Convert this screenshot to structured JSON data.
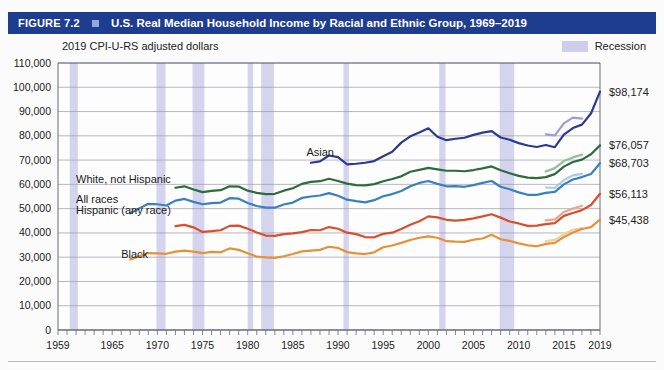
{
  "figure": {
    "number_label": "FIGURE 7.2",
    "marker_icon": "square-marker-icon",
    "title": "U.S. Real Median Household Income by Racial and Ethnic Group, 1969–2019",
    "subtitle": "2019 CPI-U-RS adjusted dollars"
  },
  "legend": {
    "items": [
      {
        "label": "Recession",
        "color": "#cdcdec",
        "swatch_icon": "recession-band-swatch"
      }
    ]
  },
  "chart_data": {
    "type": "line",
    "title": "U.S. Real Median Household Income by Racial and Ethnic Group, 1969–2019",
    "subtitle": "2019 CPI-U-RS adjusted dollars",
    "xlabel": "",
    "ylabel": "2019 CPI-U-RS adjusted dollars",
    "xlim": [
      1959,
      2019
    ],
    "ylim": [
      0,
      110000
    ],
    "grid": true,
    "legend_position": "top-right",
    "ytick_labels": [
      "0",
      "10,000",
      "20,000",
      "30,000",
      "40,000",
      "50,000",
      "60,000",
      "70,000",
      "80,000",
      "90,000",
      "100,000",
      "110,000"
    ],
    "yticks": [
      0,
      10000,
      20000,
      30000,
      40000,
      50000,
      60000,
      70000,
      80000,
      90000,
      100000,
      110000
    ],
    "xtick_labels": [
      "1959",
      "1965",
      "1970",
      "1975",
      "1980",
      "1985",
      "1990",
      "1995",
      "2000",
      "2005",
      "2010",
      "2015",
      "2019"
    ],
    "xticks": [
      1959,
      1965,
      1970,
      1975,
      1980,
      1985,
      1990,
      1995,
      2000,
      2005,
      2010,
      2015,
      2019
    ],
    "end_value_labels": [
      {
        "text": "$98,174",
        "series": "Asian",
        "value": 98174,
        "year": 2019
      },
      {
        "text": "$76,057",
        "series": "White, not Hispanic",
        "value": 76057,
        "year": 2019
      },
      {
        "text": "$68,703",
        "series": "All races",
        "value": 68703,
        "year": 2019
      },
      {
        "text": "$56,113",
        "series": "Hispanic (any race)",
        "value": 56113,
        "year": 2019
      },
      {
        "text": "$45,438",
        "series": "Black",
        "value": 45438,
        "year": 2019
      }
    ],
    "recession_bands": [
      {
        "start": 1960.3,
        "end": 1961.2
      },
      {
        "start": 1969.9,
        "end": 1970.9
      },
      {
        "start": 1973.9,
        "end": 1975.2
      },
      {
        "start": 1980.0,
        "end": 1980.6
      },
      {
        "start": 1981.5,
        "end": 1982.9
      },
      {
        "start": 1990.6,
        "end": 1991.2
      },
      {
        "start": 2001.2,
        "end": 2001.9
      },
      {
        "start": 2007.9,
        "end": 2009.5
      }
    ],
    "series": [
      {
        "name": "Asian",
        "color": "#2b3a8f",
        "redesign_color": "#9a9ed4",
        "label_x": 1986.5,
        "label_y": 71500,
        "x": [
          1987,
          1988,
          1989,
          1990,
          1991,
          1992,
          1993,
          1994,
          1995,
          1996,
          1997,
          1998,
          1999,
          2000,
          2001,
          2002,
          2003,
          2004,
          2005,
          2006,
          2007,
          2008,
          2009,
          2010,
          2011,
          2012,
          2013,
          2014,
          2015,
          2016,
          2017,
          2018,
          2019
        ],
        "values": [
          68900,
          69500,
          71900,
          71200,
          68200,
          68500,
          68900,
          69600,
          71600,
          73400,
          77200,
          79800,
          81400,
          83100,
          79600,
          78200,
          78800,
          79200,
          80400,
          81300,
          81900,
          79300,
          78400,
          77000,
          76000,
          75400,
          76200,
          75300,
          80500,
          83200,
          84600,
          89200,
          98174
        ],
        "redesign_x": [
          2013,
          2014,
          2015,
          2016,
          2017
        ],
        "redesign_values": [
          80600,
          80200,
          85100,
          87500,
          87100
        ]
      },
      {
        "name": "White, not Hispanic",
        "color": "#2f6b3a",
        "redesign_color": "#93bd9c",
        "label_x": 1961.0,
        "label_y": 60500,
        "x": [
          1972,
          1973,
          1974,
          1975,
          1976,
          1977,
          1978,
          1979,
          1980,
          1981,
          1982,
          1983,
          1984,
          1985,
          1986,
          1987,
          1988,
          1989,
          1990,
          1991,
          1992,
          1993,
          1994,
          1995,
          1996,
          1997,
          1998,
          1999,
          2000,
          2001,
          2002,
          2003,
          2004,
          2005,
          2006,
          2007,
          2008,
          2009,
          2010,
          2011,
          2012,
          2013,
          2014,
          2015,
          2016,
          2017,
          2018,
          2019
        ],
        "values": [
          58600,
          59200,
          57900,
          56800,
          57300,
          57600,
          59200,
          59100,
          57400,
          56500,
          56000,
          56100,
          57400,
          58400,
          60200,
          61000,
          61300,
          62300,
          61400,
          60300,
          59700,
          59600,
          60100,
          61300,
          62200,
          63300,
          65200,
          66000,
          66800,
          66200,
          65600,
          65600,
          65400,
          65900,
          66600,
          67400,
          65800,
          64600,
          63500,
          62800,
          62600,
          63000,
          64200,
          67300,
          69200,
          70200,
          72400,
          76057
        ],
        "redesign_x": [
          2013,
          2014,
          2015,
          2016,
          2017
        ],
        "redesign_values": [
          65300,
          66700,
          69600,
          71100,
          72200
        ]
      },
      {
        "name": "All races",
        "color": "#3a7fbe",
        "redesign_color": "#a9cbe6",
        "label_x": 1961.0,
        "label_y": 52300,
        "x": [
          1967,
          1968,
          1969,
          1970,
          1971,
          1972,
          1973,
          1974,
          1975,
          1976,
          1977,
          1978,
          1979,
          1980,
          1981,
          1982,
          1983,
          1984,
          1985,
          1986,
          1987,
          1988,
          1989,
          1990,
          1991,
          1992,
          1993,
          1994,
          1995,
          1996,
          1997,
          1998,
          1999,
          2000,
          2001,
          2002,
          2003,
          2004,
          2005,
          2006,
          2007,
          2008,
          2009,
          2010,
          2011,
          2012,
          2013,
          2014,
          2015,
          2016,
          2017,
          2018,
          2019
        ],
        "values": [
          48100,
          50100,
          52000,
          51800,
          51300,
          53300,
          54000,
          52800,
          51800,
          52300,
          52500,
          54300,
          54100,
          52300,
          51100,
          50400,
          50400,
          51700,
          52500,
          54400,
          55000,
          55400,
          56400,
          55300,
          53700,
          53100,
          52600,
          53500,
          55100,
          56000,
          57300,
          59200,
          60600,
          61400,
          60200,
          59200,
          59300,
          59000,
          59700,
          60600,
          61400,
          59000,
          58000,
          56700,
          55700,
          55700,
          56500,
          56900,
          60000,
          62000,
          63000,
          64300,
          68703
        ],
        "redesign_x": [
          2013,
          2014,
          2015,
          2016,
          2017
        ],
        "redesign_values": [
          58700,
          58500,
          61800,
          63700,
          64300
        ]
      },
      {
        "name": "Hispanic (any race)",
        "color": "#d94f2b",
        "redesign_color": "#eda790",
        "label_x": 1961.0,
        "label_y": 47700,
        "x": [
          1972,
          1973,
          1974,
          1975,
          1976,
          1977,
          1978,
          1979,
          1980,
          1981,
          1982,
          1983,
          1984,
          1985,
          1986,
          1987,
          1988,
          1989,
          1990,
          1991,
          1992,
          1993,
          1994,
          1995,
          1996,
          1997,
          1998,
          1999,
          2000,
          2001,
          2002,
          2003,
          2004,
          2005,
          2006,
          2007,
          2008,
          2009,
          2010,
          2011,
          2012,
          2013,
          2014,
          2015,
          2016,
          2017,
          2018,
          2019
        ],
        "values": [
          42800,
          43300,
          42300,
          40400,
          40700,
          41100,
          42900,
          43000,
          41700,
          40200,
          38900,
          38800,
          39500,
          39800,
          40300,
          41200,
          41100,
          42400,
          41700,
          40100,
          39500,
          38300,
          38200,
          39600,
          40100,
          41600,
          43400,
          44800,
          46800,
          46400,
          45400,
          45100,
          45400,
          46000,
          46800,
          47700,
          46300,
          44700,
          43900,
          42900,
          43000,
          43600,
          44000,
          47000,
          48200,
          49400,
          51500,
          56113
        ],
        "redesign_x": [
          2013,
          2014,
          2015,
          2016,
          2017
        ],
        "redesign_values": [
          45200,
          45600,
          48600,
          50000,
          51200
        ]
      },
      {
        "name": "Black",
        "color": "#e69138",
        "redesign_color": "#f2cfa4",
        "label_x": 1966.0,
        "label_y": 29500,
        "x": [
          1967,
          1968,
          1969,
          1970,
          1971,
          1972,
          1973,
          1974,
          1975,
          1976,
          1977,
          1978,
          1979,
          1980,
          1981,
          1982,
          1983,
          1984,
          1985,
          1986,
          1987,
          1988,
          1989,
          1990,
          1991,
          1992,
          1993,
          1994,
          1995,
          1996,
          1997,
          1998,
          1999,
          2000,
          2001,
          2002,
          2003,
          2004,
          2005,
          2006,
          2007,
          2008,
          2009,
          2010,
          2011,
          2012,
          2013,
          2014,
          2015,
          2016,
          2017,
          2018,
          2019
        ],
        "values": [
          29100,
          30400,
          31700,
          31600,
          31400,
          32300,
          32700,
          32300,
          31700,
          32200,
          32000,
          33600,
          33000,
          31600,
          30200,
          29900,
          29700,
          30400,
          31300,
          32400,
          32700,
          33000,
          34300,
          33800,
          32100,
          31600,
          31300,
          32000,
          34100,
          34800,
          35900,
          37100,
          38000,
          38600,
          38000,
          36600,
          36400,
          36300,
          37200,
          37700,
          39200,
          37400,
          36700,
          35700,
          34900,
          34500,
          35500,
          35900,
          38300,
          40200,
          41600,
          42400,
          45438
        ],
        "redesign_x": [
          2013,
          2014,
          2015,
          2016,
          2017
        ],
        "redesign_values": [
          36600,
          37100,
          39500,
          41300,
          42000
        ]
      }
    ]
  },
  "series_labels": [
    {
      "name": "asian-label",
      "text": "Asian"
    },
    {
      "name": "white-label",
      "text": "White, not Hispanic"
    },
    {
      "name": "all-races-label",
      "text": "All races"
    },
    {
      "name": "hispanic-label",
      "text": "Hispanic (any race)"
    },
    {
      "name": "black-label",
      "text": "Black"
    }
  ]
}
